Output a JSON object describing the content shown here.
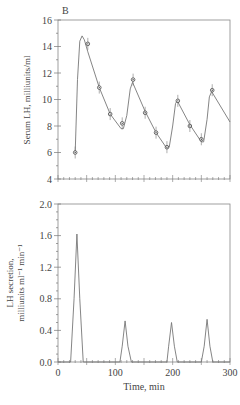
{
  "panel_label": "B",
  "chart_data": [
    {
      "type": "line",
      "title": "",
      "panel": "B (top)",
      "xlabel": "",
      "ylabel": "Serum LH, milliunits/ml",
      "xlim": [
        0,
        300
      ],
      "ylim": [
        4,
        16
      ],
      "yticks": [
        4,
        6,
        8,
        10,
        12,
        14,
        16
      ],
      "grid": false,
      "series": [
        {
          "name": "Observed (points with error bars)",
          "x": [
            30,
            52,
            72,
            91,
            112,
            131,
            152,
            171,
            190,
            209,
            230,
            250,
            269
          ],
          "y": [
            6.0,
            14.2,
            10.9,
            8.9,
            8.2,
            11.5,
            9.0,
            7.5,
            6.4,
            9.9,
            8.0,
            7.0,
            10.7
          ]
        },
        {
          "name": "Fitted curve",
          "x": [
            30,
            34,
            38,
            42,
            46,
            52,
            72,
            91,
            110,
            114,
            120,
            126,
            130,
            152,
            171,
            190,
            194,
            200,
            205,
            208,
            230,
            250,
            254,
            260,
            264,
            268,
            300
          ],
          "y": [
            6.0,
            11.5,
            14.4,
            14.8,
            14.5,
            13.6,
            10.9,
            8.9,
            7.8,
            7.8,
            8.8,
            10.8,
            11.3,
            9.1,
            7.5,
            6.3,
            6.4,
            8.0,
            9.7,
            9.9,
            8.1,
            6.8,
            6.8,
            8.5,
            10.2,
            10.6,
            8.3
          ]
        }
      ]
    },
    {
      "type": "line",
      "title": "",
      "panel": "B (bottom)",
      "xlabel": "Time, min",
      "ylabel": "LH secretion, milliunits ml⁻¹ min⁻¹",
      "xlim": [
        0,
        300
      ],
      "ylim": [
        0.0,
        2.0
      ],
      "xticks": [
        0,
        100,
        200,
        300
      ],
      "yticks": [
        0.0,
        0.4,
        0.8,
        1.2,
        1.6,
        2.0
      ],
      "grid": false,
      "series": [
        {
          "name": "Secretion pulses",
          "x": [
            0,
            22,
            28,
            33,
            38,
            44,
            108,
            112,
            117,
            122,
            128,
            190,
            193,
            198,
            203,
            208,
            250,
            255,
            260,
            265,
            270,
            300
          ],
          "y": [
            0,
            0,
            0.8,
            1.62,
            0.8,
            0,
            0,
            0.2,
            0.52,
            0.2,
            0,
            0,
            0.2,
            0.5,
            0.2,
            0,
            0,
            0.2,
            0.54,
            0.2,
            0,
            0
          ]
        }
      ]
    }
  ],
  "top": {
    "ylabel": "Serum LH, milliunits/ml",
    "yticks": [
      "4",
      "6",
      "8",
      "10",
      "12",
      "14",
      "16"
    ]
  },
  "bottom": {
    "ylabel_line1": "LH secretion,",
    "ylabel_line2": "milliunits ml⁻¹ min⁻¹",
    "yticks": [
      "0.0",
      "0.4",
      "0.8",
      "1.2",
      "1.6",
      "2.0"
    ],
    "xticks": [
      "0",
      "100",
      "200",
      "300"
    ],
    "xlabel": "Time, min"
  }
}
